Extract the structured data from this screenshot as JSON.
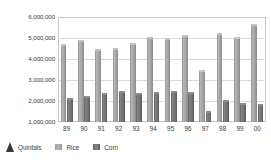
{
  "chart_data": {
    "type": "bar",
    "title": "",
    "subtitle": "",
    "xlabel": "",
    "ylabel": "Quintals",
    "ylim": [
      1000000,
      6000000
    ],
    "ytick_values": [
      1000000,
      2000000,
      3000000,
      4000000,
      5000000,
      6000000
    ],
    "ytick_labels": [
      "1,000,000",
      "2,000,000",
      "3,000,000",
      "4,000,000",
      "5,000,000",
      "6,000,000"
    ],
    "grid": true,
    "legend_position": "bottom-left",
    "categories": [
      "89",
      "90",
      "91",
      "92",
      "93",
      "94",
      "95",
      "96",
      "97",
      "98",
      "99",
      "00"
    ],
    "series": [
      {
        "name": "Rice",
        "color": "#a6a6a6",
        "values": [
          4600000,
          4800000,
          4400000,
          4420000,
          4650000,
          4950000,
          4900000,
          5070000,
          3400000,
          5120000,
          4950000,
          5560000
        ]
      },
      {
        "name": "Corn",
        "color": "#767676",
        "values": [
          2050000,
          2140000,
          2300000,
          2360000,
          2300000,
          2350000,
          2380000,
          2330000,
          1450000,
          1960000,
          1800000,
          1760000
        ]
      }
    ],
    "annotations": []
  },
  "legend": {
    "unit_marker_name": "cone-marker",
    "unit_label": "Quintals",
    "items": [
      {
        "label": "Rice",
        "swatch": "rice-swatch"
      },
      {
        "label": "Corn",
        "swatch": "corn-swatch"
      }
    ]
  }
}
